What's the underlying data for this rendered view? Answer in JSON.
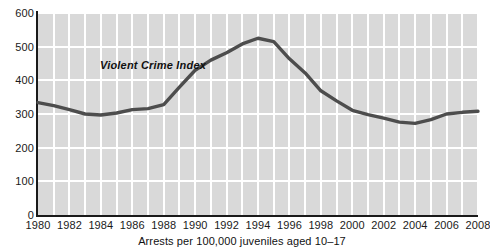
{
  "chart_data": {
    "type": "line",
    "title": "",
    "subtitle": "",
    "xlabel": "",
    "ylabel": "",
    "caption": "Arrests per 100,000 juveniles aged 10–17",
    "series_label": "Violent Crime Index",
    "grid": true,
    "legend_position": "inline-annotation",
    "xlim": [
      1980,
      2008
    ],
    "ylim": [
      0,
      600
    ],
    "y_ticks": [
      0,
      100,
      200,
      300,
      400,
      500,
      600
    ],
    "y_tick_labels": [
      "0",
      "100",
      "200",
      "300",
      "400",
      "500",
      "600"
    ],
    "x_ticks": [
      1980,
      1982,
      1984,
      1986,
      1988,
      1990,
      1992,
      1994,
      1996,
      1998,
      2000,
      2002,
      2004,
      2006,
      2008
    ],
    "x_tick_labels": [
      "1980",
      "1982",
      "1984",
      "1986",
      "1988",
      "1990",
      "1992",
      "1994",
      "1996",
      "1998",
      "2000",
      "2002",
      "2004",
      "2006",
      "2008"
    ],
    "x_gridline_step": 1,
    "y_gridline_step": 100,
    "series": [
      {
        "name": "Violent Crime Index",
        "color": "#4d4d4d",
        "x": [
          1980,
          1981,
          1982,
          1983,
          1984,
          1985,
          1986,
          1987,
          1988,
          1989,
          1990,
          1991,
          1992,
          1993,
          1994,
          1995,
          1996,
          1997,
          1998,
          1999,
          2000,
          2001,
          2002,
          2003,
          2004,
          2005,
          2006,
          2007,
          2008
        ],
        "values": [
          334,
          325,
          313,
          300,
          297,
          303,
          313,
          316,
          328,
          380,
          430,
          460,
          482,
          508,
          525,
          515,
          464,
          422,
          369,
          339,
          311,
          298,
          288,
          276,
          272,
          283,
          300,
          305,
          308
        ]
      }
    ],
    "annotations": [
      {
        "text": "Violent Crime Index",
        "x": 1987,
        "y": 435,
        "style": "bold-italic"
      }
    ],
    "colors": {
      "plot_background": "#d9d9d9",
      "gridline": "#ffffff",
      "axis": "#1a1a1a",
      "line": "#4d4d4d",
      "text": "#111111",
      "page_background": "#ffffff"
    }
  }
}
